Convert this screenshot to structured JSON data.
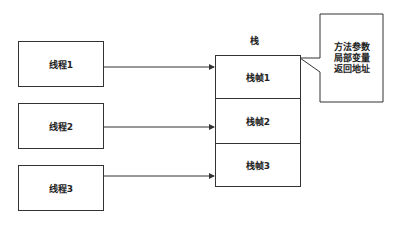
{
  "diagram": {
    "stack_title": "栈",
    "threads": [
      {
        "label": "线程1"
      },
      {
        "label": "线程2"
      },
      {
        "label": "线程3"
      }
    ],
    "frames": [
      {
        "label": "栈帧1"
      },
      {
        "label": "栈帧2"
      },
      {
        "label": "栈帧3"
      }
    ],
    "callout": {
      "lines": [
        "方法参数",
        "局部变量",
        "返回地址"
      ]
    },
    "colors": {
      "stroke": "#333333",
      "background": "#ffffff",
      "text": "#222222"
    }
  }
}
